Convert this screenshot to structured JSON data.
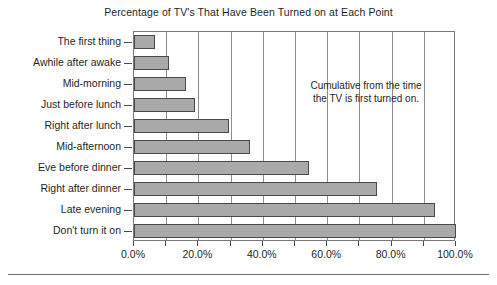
{
  "chart_data": {
    "type": "bar",
    "orientation": "horizontal",
    "title": "Percentage of TV's That Have Been Turned on at Each Point",
    "xlabel": "",
    "ylabel": "",
    "categories": [
      "The first thing",
      "Awhile after awake",
      "Mid-morning",
      "Just before lunch",
      "Right after lunch",
      "Mid-afternoon",
      "Eve before dinner",
      "Right after dinner",
      "Late evening",
      "Don't turn it on"
    ],
    "values": [
      6.5,
      11.0,
      16.0,
      19.0,
      29.5,
      36.0,
      54.5,
      75.5,
      93.5,
      100.0
    ],
    "value_unit": "%",
    "xlim": [
      0,
      100
    ],
    "xticks": [
      0,
      10,
      20,
      30,
      40,
      50,
      60,
      70,
      80,
      90,
      100
    ],
    "xtick_labels": [
      "0.0%",
      "20.0%",
      "40.0%",
      "60.0%",
      "80.0%",
      "100.0%"
    ],
    "xtick_label_values": [
      0,
      20,
      40,
      60,
      80,
      100
    ],
    "grid": true,
    "grid_axis": "x",
    "legend": false,
    "annotations": [
      {
        "lines": [
          "Cumulative from the time",
          "the TV is first turned on."
        ]
      }
    ],
    "colors": {
      "bar_fill": "#a9a9a9",
      "bar_border": "#4a4a4a",
      "gridline": "#8d8d8d",
      "frame": "#7a7a7a",
      "text": "#1f1f1f",
      "background": "#ffffff"
    }
  }
}
